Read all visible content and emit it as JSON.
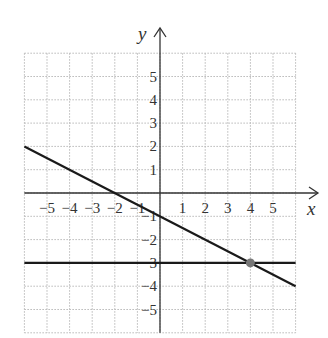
{
  "chart_data": {
    "type": "line",
    "title": "",
    "xlabel": "x",
    "ylabel": "y",
    "xlim": [
      -6,
      6
    ],
    "ylim": [
      -6,
      6
    ],
    "grid": true,
    "x_ticks": [
      -5,
      -4,
      -3,
      -2,
      -1,
      1,
      2,
      3,
      4,
      5
    ],
    "y_ticks": [
      5,
      4,
      3,
      2,
      1,
      -1,
      -2,
      -3,
      -4,
      -5
    ],
    "x_tick_labels": [
      "−5",
      "−4",
      "−3",
      "−2",
      "−1",
      "1",
      "2",
      "3",
      "4",
      "5"
    ],
    "y_tick_labels": [
      "5",
      "4",
      "3",
      "2",
      "1",
      "−1",
      "−2",
      "−3",
      "−4",
      "−5"
    ],
    "series": [
      {
        "name": "y = -x/2 - 1",
        "x": [
          -6,
          6
        ],
        "y": [
          2,
          -4
        ]
      },
      {
        "name": "y = -3",
        "x": [
          -6,
          6
        ],
        "y": [
          -3,
          -3
        ]
      }
    ],
    "points": [
      {
        "name": "intersection",
        "x": 4,
        "y": -3,
        "color": "#777777"
      }
    ],
    "colors": {
      "line": "#1a1a1a",
      "axis": "#333333",
      "grid": "#b8b8b8",
      "point": "#777777"
    }
  }
}
